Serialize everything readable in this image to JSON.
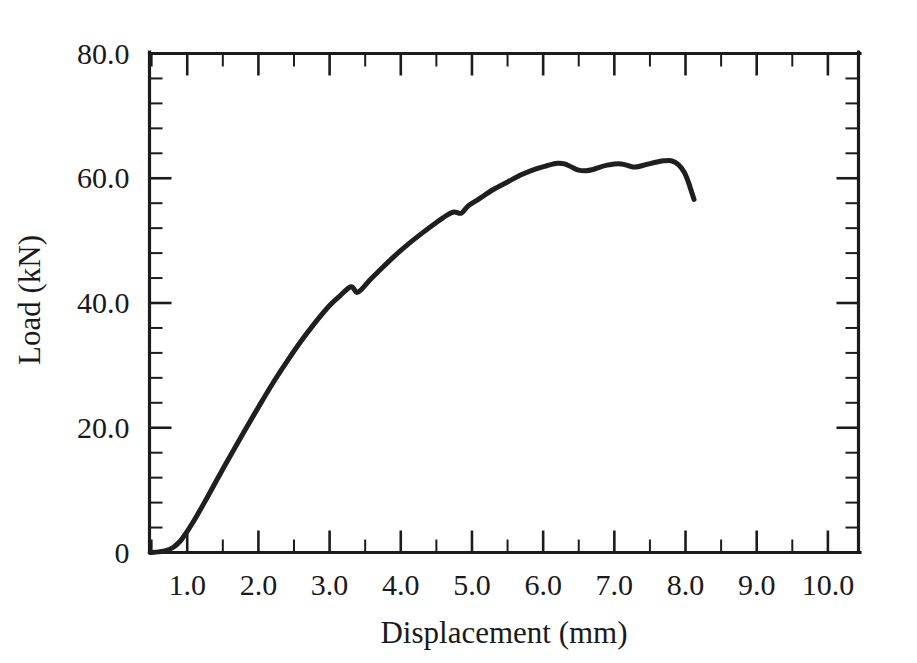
{
  "chart_data": {
    "type": "line",
    "title": "",
    "xlabel": "Displacement  (mm)",
    "ylabel": "Load (kN)",
    "xlim": [
      0.47,
      10.43
    ],
    "ylim": [
      0,
      80
    ],
    "grid": false,
    "legend": null,
    "x_tick_labels": [
      "1.0",
      "2.0",
      "3.0",
      "4.0",
      "5.0",
      "6.0",
      "7.0",
      "8.0",
      "9.0",
      "10.0"
    ],
    "x_tick_values": [
      1.0,
      2.0,
      3.0,
      4.0,
      5.0,
      6.0,
      7.0,
      8.0,
      9.0,
      10.0
    ],
    "x_minor_step": 0.5,
    "y_tick_labels": [
      "0",
      "20.0",
      "40.0",
      "60.0",
      "80.0"
    ],
    "y_tick_values": [
      0,
      20,
      40,
      60,
      80
    ],
    "y_minor_step": 4,
    "series": [
      {
        "name": "Load-displacement response",
        "color": "#1f1f1f",
        "x": [
          0.48,
          0.6,
          0.7,
          0.8,
          0.9,
          1.0,
          1.1,
          1.25,
          1.4,
          1.6,
          1.8,
          2.0,
          2.2,
          2.4,
          2.6,
          2.8,
          3.0,
          3.15,
          3.3,
          3.38,
          3.45,
          3.55,
          3.7,
          3.9,
          4.1,
          4.3,
          4.5,
          4.65,
          4.75,
          4.85,
          4.95,
          5.1,
          5.3,
          5.5,
          5.7,
          5.9,
          6.05,
          6.2,
          6.3,
          6.4,
          6.5,
          6.6,
          6.7,
          6.8,
          6.9,
          7.0,
          7.1,
          7.2,
          7.3,
          7.45,
          7.6,
          7.7,
          7.8,
          7.9,
          7.98,
          8.04,
          8.08,
          8.12
        ],
        "y": [
          0.0,
          0.1,
          0.3,
          0.8,
          1.8,
          3.4,
          5.2,
          8.2,
          11.3,
          15.4,
          19.4,
          23.3,
          27.1,
          30.6,
          33.9,
          36.9,
          39.6,
          41.2,
          42.6,
          41.7,
          42.2,
          43.5,
          45.2,
          47.4,
          49.4,
          51.2,
          52.9,
          54.1,
          54.6,
          54.4,
          55.6,
          56.7,
          58.2,
          59.4,
          60.6,
          61.5,
          62.0,
          62.4,
          62.3,
          61.8,
          61.3,
          61.2,
          61.4,
          61.8,
          62.1,
          62.3,
          62.3,
          62.0,
          61.8,
          62.2,
          62.6,
          62.8,
          62.8,
          62.2,
          61.0,
          59.4,
          58.0,
          56.6
        ]
      }
    ]
  }
}
